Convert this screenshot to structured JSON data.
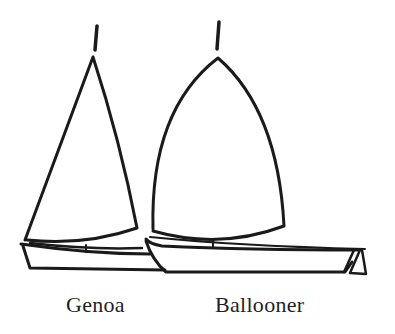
{
  "figure": {
    "type": "line-drawing",
    "ink_color": "#1a1a1a",
    "background": "#ffffff"
  },
  "boats": [
    {
      "id": "genoa",
      "label": "Genoa",
      "sail_shape": "triangular"
    },
    {
      "id": "ballooner",
      "label": "Ballooner",
      "sail_shape": "bellied"
    }
  ]
}
